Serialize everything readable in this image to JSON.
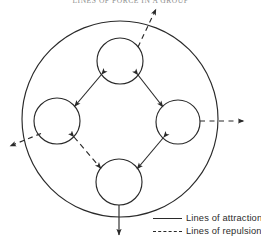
{
  "figure": {
    "title": "LINES OF FORCE IN A GROUP",
    "stroke_color": "#2a2a2a",
    "background_color": "#ffffff"
  },
  "diagram": {
    "type": "node-link-diagram",
    "outer_boundary": {
      "name": "group-boundary",
      "shape": "circle",
      "cx": 120,
      "cy": 119,
      "r": 98,
      "style": "solid"
    },
    "nodes": [
      {
        "id": "top",
        "name": "member-top",
        "cx": 120,
        "cy": 61,
        "r": 23
      },
      {
        "id": "left",
        "name": "member-left",
        "cx": 57,
        "cy": 121,
        "r": 23
      },
      {
        "id": "right",
        "name": "member-right",
        "cx": 178,
        "cy": 122,
        "r": 22
      },
      {
        "id": "bottom",
        "name": "member-bottom",
        "cx": 119,
        "cy": 182,
        "r": 23
      }
    ],
    "internal_links": [
      {
        "from": "top",
        "to": "left",
        "style": "solid",
        "force": "attraction",
        "arrows": "both"
      },
      {
        "from": "top",
        "to": "right",
        "style": "solid",
        "force": "attraction",
        "arrows": "both"
      },
      {
        "from": "right",
        "to": "bottom",
        "style": "solid",
        "force": "attraction",
        "arrows": "both"
      },
      {
        "from": "left",
        "to": "bottom",
        "style": "dashed",
        "force": "repulsion",
        "arrows": "both"
      }
    ],
    "external_links": [
      {
        "from": "top",
        "direction": "up-right",
        "style": "dashed",
        "force": "repulsion",
        "x1": 139,
        "y1": 46,
        "x2": 156,
        "y2": 8
      },
      {
        "from": "left",
        "direction": "down-left",
        "style": "dashed",
        "force": "repulsion",
        "x1": 40,
        "y1": 134,
        "x2": 9,
        "y2": 147
      },
      {
        "from": "right",
        "direction": "right",
        "style": "dashed",
        "force": "repulsion",
        "x1": 200,
        "y1": 121,
        "x2": 245,
        "y2": 121
      },
      {
        "from": "bottom",
        "direction": "down",
        "style": "solid",
        "force": "attraction",
        "x1": 119,
        "y1": 205,
        "x2": 119,
        "y2": 236
      }
    ]
  },
  "legend": {
    "name": "legend",
    "entries": [
      {
        "style": "solid",
        "label": "Lines of attraction"
      },
      {
        "style": "dashed",
        "label": "Lines of repulsion"
      }
    ]
  }
}
